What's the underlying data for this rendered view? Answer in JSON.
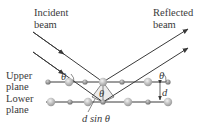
{
  "labels": {
    "incident_1": "Incident",
    "incident_2": "beam",
    "reflected_1": "Reflected",
    "reflected_2": "beam",
    "upper_1": "Upper",
    "upper_2": "plane",
    "lower_1": "Lower",
    "lower_2": "plane",
    "theta": "θ",
    "d": "d",
    "path_diff": "d sin θ"
  },
  "colors": {
    "line": "#3a3a3a",
    "atom_light": "#d9d9d9",
    "atom_dark": "#8c8c8c",
    "shade": "#e6e6e6"
  }
}
